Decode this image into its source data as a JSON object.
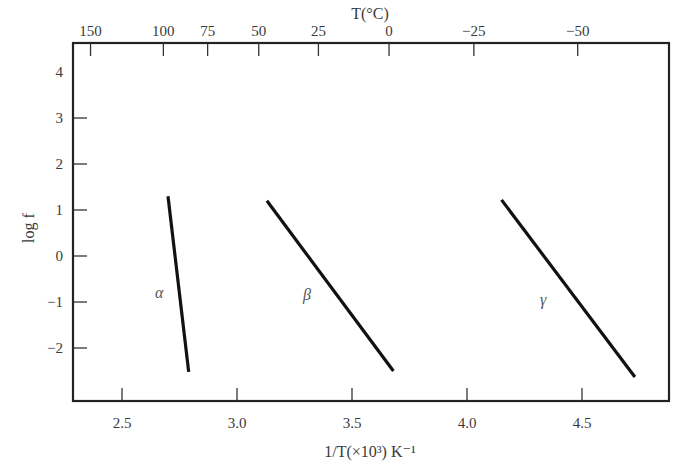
{
  "chart_data": {
    "type": "line",
    "title": "",
    "xlabel": "1/T(×10³) K⁻¹",
    "ylabel": "log f",
    "x2label": "T(°C)",
    "xlim": [
      2.29,
      4.88
    ],
    "ylim": [
      -3.1,
      4
    ],
    "grid": false,
    "legend": "inline labels",
    "x_ticks": [
      2.5,
      3.0,
      3.5,
      4.0,
      4.5
    ],
    "x_tick_labels": [
      "2.5",
      "3.0",
      "3.5",
      "4.0",
      "4.5"
    ],
    "y_ticks": [
      4,
      3,
      2,
      1,
      0,
      -1,
      -2
    ],
    "y_tick_labels": [
      "4",
      "3",
      "2",
      "1",
      "0",
      "−1",
      "−2"
    ],
    "x2_ticks_celsius": [
      150,
      100,
      75,
      50,
      25,
      0,
      -25,
      -50
    ],
    "x2_tick_labels": [
      "150",
      "100",
      "75",
      "50",
      "25",
      "0",
      "−25",
      "−50"
    ],
    "series": [
      {
        "name": "α",
        "x": [
          2.7,
          2.79
        ],
        "y": [
          1.3,
          -2.52
        ]
      },
      {
        "name": "β",
        "x": [
          3.13,
          3.68
        ],
        "y": [
          1.2,
          -2.5
        ]
      },
      {
        "name": "γ",
        "x": [
          4.15,
          4.73
        ],
        "y": [
          1.22,
          -2.63
        ]
      }
    ]
  },
  "labels": {
    "x_axis_title": "1/T(×10³) K⁻¹",
    "y_axis_title": "log f",
    "top_axis_title": "T(°C)",
    "alpha": "α",
    "beta": "β",
    "gamma": "γ"
  }
}
